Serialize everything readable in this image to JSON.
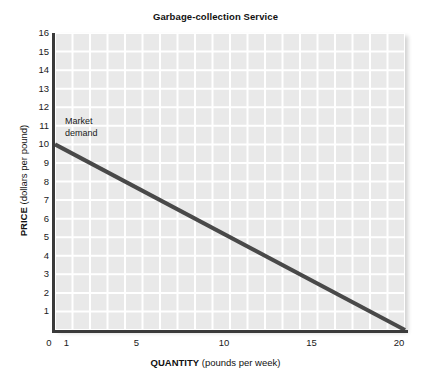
{
  "chart_data": {
    "type": "line",
    "title": "Garbage-collection Service",
    "xlabel_bold": "QUANTITY",
    "xlabel_rest": "(pounds per week)",
    "ylabel_bold": "PRICE",
    "ylabel_rest": "(dollars per pound)",
    "xlim": [
      0,
      20
    ],
    "ylim": [
      0,
      16
    ],
    "x_ticks": [
      0,
      1,
      5,
      10,
      15,
      20
    ],
    "x_tick_labels": [
      "0",
      "1",
      "5",
      "10",
      "15",
      "20"
    ],
    "y_ticks": [
      1,
      2,
      3,
      4,
      5,
      6,
      7,
      8,
      9,
      10,
      11,
      12,
      13,
      14,
      15,
      16
    ],
    "y_tick_labels": [
      "1",
      "2",
      "3",
      "4",
      "5",
      "6",
      "7",
      "8",
      "9",
      "10",
      "11",
      "12",
      "13",
      "14",
      "15",
      "16"
    ],
    "x_grid_step": 1,
    "y_grid_step": 1,
    "grid": true,
    "grid_color": "#ffffff",
    "plot_background": "#e9e9e9",
    "legend": "none",
    "series": [
      {
        "name": "Market demand",
        "color": "#494949",
        "line_width": 4,
        "x": [
          0,
          20
        ],
        "y": [
          10,
          0
        ],
        "annotation_line1": "Market",
        "annotation_line2": "demand",
        "annotation_x": 0.4,
        "annotation_y": 11.2
      }
    ]
  }
}
